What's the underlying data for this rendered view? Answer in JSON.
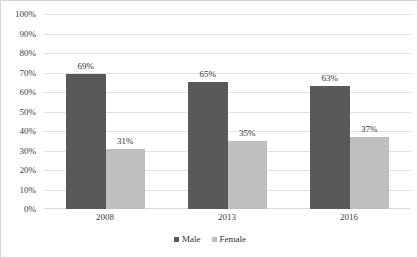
{
  "chart_data": {
    "type": "bar",
    "title": "",
    "subtitle": "",
    "xlabel": "",
    "ylabel": "",
    "categories": [
      "2008",
      "2013",
      "2016"
    ],
    "series": [
      {
        "name": "Male",
        "color": "#595959",
        "values": [
          69,
          65,
          63
        ],
        "labels": [
          "69%",
          "31%"
        ]
      },
      {
        "name": "Female",
        "color": "#bfbfbf",
        "values": [
          31,
          35,
          37
        ],
        "labels": []
      }
    ],
    "point_labels": {
      "male": [
        "69%",
        "65%",
        "63%"
      ],
      "female": [
        "31%",
        "35%",
        "37%"
      ]
    },
    "ylim": [
      0,
      100
    ],
    "ytick_values": [
      100,
      90,
      80,
      70,
      60,
      50,
      40,
      30,
      20,
      10,
      0
    ],
    "ytick_labels": [
      "100%",
      "90%",
      "80%",
      "70%",
      "60%",
      "50%",
      "40%",
      "30%",
      "20%",
      "10%",
      "0%"
    ],
    "grid": true,
    "grid_color": "#e2e2e2",
    "legend_position": "bottom",
    "legend_entries": [
      "Male",
      "Female"
    ],
    "background": "#ffffff",
    "border_color": "#d4d4d4"
  },
  "axes": {
    "y": {
      "ticks": [
        {
          "label": "100%",
          "value": 100
        },
        {
          "label": "90%",
          "value": 90
        },
        {
          "label": "80%",
          "value": 80
        },
        {
          "label": "70%",
          "value": 70
        },
        {
          "label": "60%",
          "value": 60
        },
        {
          "label": "50%",
          "value": 50
        },
        {
          "label": "40%",
          "value": 40
        },
        {
          "label": "30%",
          "value": 30
        },
        {
          "label": "20%",
          "value": 20
        },
        {
          "label": "10%",
          "value": 10
        },
        {
          "label": "0%",
          "value": 0
        }
      ]
    },
    "x": {
      "ticks": [
        {
          "label": "2008"
        },
        {
          "label": "2013"
        },
        {
          "label": "2016"
        }
      ]
    }
  },
  "groups": [
    {
      "category": "2008",
      "male": {
        "value": 69,
        "label": "69%"
      },
      "female": {
        "value": 31,
        "label": "31%"
      }
    },
    {
      "category": "2013",
      "male": {
        "value": 65,
        "label": "65%"
      },
      "female": {
        "value": 35,
        "label": "35%"
      }
    },
    {
      "category": "2016",
      "male": {
        "value": 63,
        "label": "63%"
      },
      "female": {
        "value": 37,
        "label": "37%"
      }
    }
  ],
  "legend": {
    "items": [
      {
        "label": "Male",
        "color": "#595959"
      },
      {
        "label": "Female",
        "color": "#bfbfbf"
      }
    ]
  }
}
